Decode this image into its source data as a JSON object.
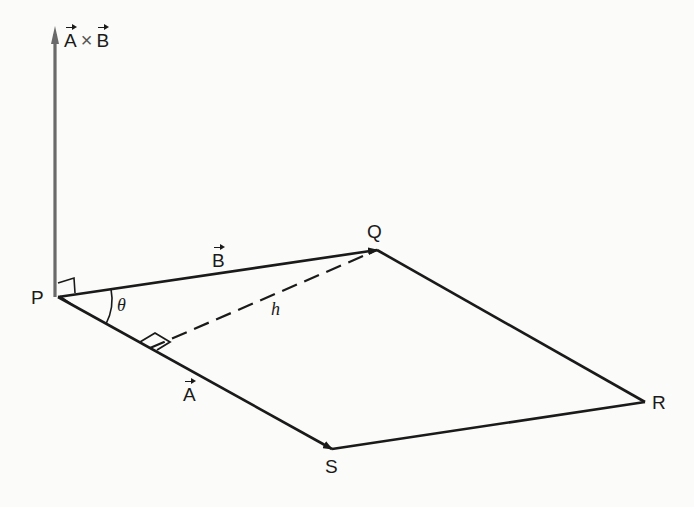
{
  "diagram": {
    "colors": {
      "line": "#1a1a1a",
      "axis_line": "#6a6a6a",
      "background": "#fbfbf9"
    },
    "vertices": {
      "P": {
        "label": "P",
        "x": 58,
        "y": 297
      },
      "Q": {
        "label": "Q",
        "x": 377,
        "y": 250
      },
      "R": {
        "label": "R",
        "x": 645,
        "y": 402
      },
      "S": {
        "label": "S",
        "x": 332,
        "y": 449
      }
    },
    "labels": {
      "cross_product_A": "A",
      "cross_product_op": "×",
      "cross_product_B": "B",
      "vector_B": "B",
      "vector_A": "A",
      "angle": "θ",
      "height": "h",
      "P": "P",
      "Q": "Q",
      "R": "R",
      "S": "S"
    },
    "edges": [
      {
        "from": "P",
        "to": "Q",
        "name": "vector B",
        "arrow": true
      },
      {
        "from": "P",
        "to": "S",
        "name": "vector A",
        "arrow": true
      },
      {
        "from": "Q",
        "to": "R",
        "name": "side QR",
        "arrow": false
      },
      {
        "from": "S",
        "to": "R",
        "name": "side SR",
        "arrow": false
      }
    ],
    "height_segment": {
      "from_foot_on": "PS",
      "to": "Q",
      "style": "dashed"
    },
    "normal_vector": {
      "from": "P",
      "label": "A × B",
      "direction": "up"
    }
  }
}
